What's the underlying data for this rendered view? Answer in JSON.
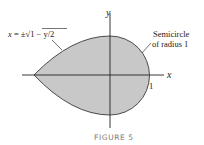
{
  "figure": {
    "caption": "FIGURE 5",
    "axes": {
      "x_label": "x",
      "y_label": "y",
      "tick_label_x": "1"
    },
    "annotations": {
      "left_curve_label": "x = ±√1 − y/2",
      "left_curve_prefix": "x = ±",
      "left_curve_radical": "1 − y/2",
      "right_label_line1": "Semicircle",
      "right_label_line2": "of radius 1"
    },
    "colors": {
      "region_fill": "#c8c8c8",
      "outline": "#3a3a3a",
      "axis": "#222222"
    }
  }
}
